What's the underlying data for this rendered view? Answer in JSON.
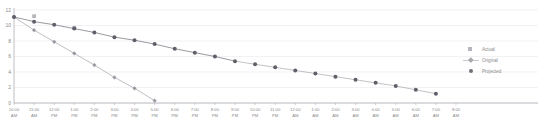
{
  "chart_data": {
    "type": "line",
    "title": "",
    "xlabel": "",
    "ylabel": "",
    "ylim": [
      0,
      12
    ],
    "yticks": [
      0,
      2,
      4,
      6,
      8,
      10,
      12
    ],
    "grid": true,
    "legend_position": "right",
    "x": [
      "10:00 AM",
      "11:00 AM",
      "12:00 PM",
      "1:00 PM",
      "2:00 PM",
      "3:00 PM",
      "4:00 PM",
      "5:00 PM",
      "6:00 PM",
      "7:00 PM",
      "8:00 PM",
      "9:00 PM",
      "10:00 PM",
      "11:00 PM",
      "12:00 AM",
      "1:00 AM",
      "2:00 AM",
      "3:00 AM",
      "4:00 AM",
      "5:00 AM",
      "6:00 AM",
      "7:00 AM",
      "8:00 AM"
    ],
    "xtick_labels_line1": [
      "10:00",
      "11:00",
      "12:00",
      "1:00",
      "2:00",
      "3:00",
      "4:00",
      "5:00",
      "6:00",
      "7:00",
      "8:00",
      "9:00",
      "10:00",
      "11:00",
      "12:00",
      "1:00",
      "2:00",
      "3:00",
      "4:00",
      "5:00",
      "6:00",
      "7:00",
      "8:00"
    ],
    "xtick_labels_line2": [
      "AM",
      "AM",
      "PM",
      "PM",
      "PM",
      "PM",
      "PM",
      "PM",
      "PM",
      "PM",
      "PM",
      "PM",
      "PM",
      "PM",
      "AM",
      "AM",
      "AM",
      "AM",
      "AM",
      "AM",
      "AM",
      "AM",
      "AM"
    ],
    "series": [
      {
        "name": "Actual",
        "marker": "square",
        "color": "#b6b6bc",
        "line": false,
        "values": [
          null,
          11.2,
          null,
          9.7,
          null,
          null,
          null,
          null,
          null,
          null,
          null,
          null,
          null,
          null,
          null,
          null,
          null,
          null,
          null,
          null,
          null,
          null,
          null
        ]
      },
      {
        "name": "Original",
        "marker": "diamond",
        "color": "#9a9aa2",
        "line": true,
        "values": [
          11.1,
          9.4,
          7.9,
          6.4,
          4.9,
          3.3,
          1.9,
          0.3,
          null,
          null,
          null,
          null,
          null,
          null,
          null,
          null,
          null,
          null,
          null,
          null,
          null,
          null,
          null
        ]
      },
      {
        "name": "Projected",
        "marker": "circle",
        "color": "#5f5f69",
        "line": true,
        "values": [
          11.1,
          10.5,
          10.1,
          9.6,
          9.1,
          8.5,
          8.1,
          7.6,
          7.0,
          6.5,
          6.0,
          5.4,
          null,
          null,
          null,
          null,
          null,
          null,
          null,
          null,
          null,
          null,
          null
        ]
      },
      {
        "name": "ProjectedExt",
        "marker": "circle",
        "color": "#5f5f69",
        "line": true,
        "values": [
          null,
          null,
          null,
          null,
          null,
          null,
          null,
          null,
          null,
          null,
          null,
          null,
          null,
          null,
          null,
          null,
          null,
          null,
          null,
          null,
          null,
          null,
          null
        ]
      }
    ],
    "legend": [
      {
        "label": "Actual",
        "marker": "square"
      },
      {
        "label": "Original",
        "marker": "diamond-line"
      },
      {
        "label": "Projected",
        "marker": "circle"
      }
    ],
    "colors": {
      "axis": "#b0b0b6",
      "grid": "#ededf0",
      "actual": "#b6b6bc",
      "original": "#9a9aa2",
      "projected": "#5f5f69",
      "tick_text": "#8a8a8a",
      "background": "#ffffff"
    }
  }
}
